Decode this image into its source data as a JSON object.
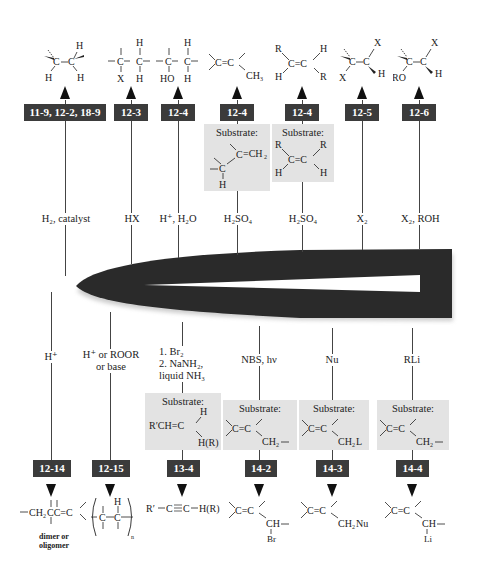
{
  "diagram": {
    "colors": {
      "label_box": "#3b3b3b",
      "substrate_box": "#e3e3e3",
      "hub": "#2a2a2a"
    }
  },
  "top_reactions": [
    {
      "section": "11-9, 12-2, 18-9",
      "reagent": "H₂, catalyst",
      "product": "syn-added H–C–C–H (alkane)"
    },
    {
      "section": "12-3",
      "reagent": "HX",
      "product": "alkyl halide (X, H)"
    },
    {
      "section": "12-4",
      "reagent": "H⁺, H₂O",
      "product": "alcohol (HO, H)"
    },
    {
      "section": "12-4",
      "reagent": "H₂SO₄",
      "substrate_title": "Substrate:",
      "substrate": "allylic C–H next to C=CH₂",
      "product": "C=C with CH₃"
    },
    {
      "section": "12-4",
      "reagent": "H₂SO₄",
      "substrate_title": "Substrate:",
      "substrate": "cis RCH=CHR",
      "product": "trans RCH=CHR"
    },
    {
      "section": "12-5",
      "reagent": "X₂",
      "product": "anti dihalide (X, X, H)"
    },
    {
      "section": "12-6",
      "reagent": "X₂, ROH",
      "product": "halo ether (RO, X, H)"
    }
  ],
  "bottom_reactions": [
    {
      "section": "12-14",
      "reagent": "H⁺",
      "product": "–CH₂C–C=C< ",
      "product_caption_line1": "dimer or",
      "product_caption_line2": "oligomer"
    },
    {
      "section": "12-15",
      "reagent_line1": "H⁺ or ROOR",
      "reagent_line2": "or base",
      "product": "polymer –(C–C)ₙ–"
    },
    {
      "section": "13-4",
      "reagent_line1": "1. Br₂",
      "reagent_line2": "2. NaNH₂,",
      "reagent_line3": "liquid NH₃",
      "substrate_title": "Substrate:",
      "substrate": "R′CH=C(H)H(R)",
      "product": "R′—C≡C—H(R)"
    },
    {
      "section": "14-2",
      "reagent": "NBS, hν",
      "substrate_title": "Substrate:",
      "substrate": "C=C–CH₂–",
      "product": "C=C–CH(Br)–"
    },
    {
      "section": "14-3",
      "reagent": "Nu",
      "substrate_title": "Substrate:",
      "substrate": "C=C–CH₂L",
      "product": "C=C–CH₂Nu"
    },
    {
      "section": "14-4",
      "reagent": "RLi",
      "substrate_title": "Substrate:",
      "substrate": "C=C–CH₂–",
      "product": "C=C–CH(Li)–"
    }
  ],
  "text": {
    "H": "H",
    "X": "X",
    "HO": "HO",
    "R": "R",
    "RO": "RO",
    "C": "C",
    "CH3": "CH₃",
    "CH2": "CH₂",
    "CH2L": "CH₂L",
    "CH2Nu": "CH₂Nu",
    "Br": "Br",
    "Li": "Li",
    "HR": "H(R)",
    "RpCH": "R′CH",
    "Rp": "R′",
    "CH2C": "CH₂C",
    "CH": "CH",
    "n": "n"
  }
}
